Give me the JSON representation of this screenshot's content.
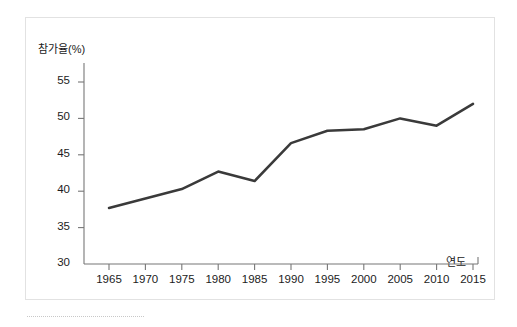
{
  "chart_data": {
    "type": "line",
    "title": "",
    "xlabel": "연도",
    "ylabel": "참가율(%)",
    "categories": [
      1965,
      1970,
      1975,
      1980,
      1985,
      1990,
      1995,
      2000,
      2005,
      2010,
      2015
    ],
    "x_tick_labels": [
      "1965",
      "1970",
      "1975",
      "1980",
      "1985",
      "1990",
      "1995",
      "2000",
      "2005",
      "2010",
      "2015"
    ],
    "values": [
      37.7,
      39.0,
      40.3,
      42.7,
      41.4,
      46.6,
      48.3,
      48.5,
      50.0,
      49.0,
      52.0
    ],
    "y_tick_labels": [
      "55",
      "50",
      "45",
      "40",
      "35",
      "30"
    ],
    "y_ticks": [
      55,
      50,
      45,
      40,
      35,
      30
    ],
    "ylim": [
      30,
      55
    ],
    "xlim": [
      1962.5,
      2017.5
    ],
    "grid": false,
    "legend": null,
    "line_color": "#3a3a3a",
    "line_width": 2.5,
    "axis_color": "#777777",
    "background_color": "#ffffff",
    "border_color": "#e2e2e2"
  }
}
